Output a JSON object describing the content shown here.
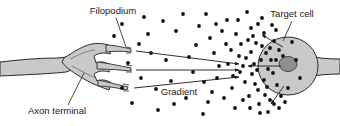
{
  "figure": {
    "domain": "biology-diagram",
    "width": 340,
    "height": 126,
    "background_color": "#ffffff"
  },
  "colors": {
    "cell_fill": "#c9c9c9",
    "cell_stroke": "#2b2b2b",
    "nucleus_fill": "#8f8f8f",
    "nucleus_stroke": "#3a3a3a",
    "dot_color": "#111111",
    "line_color": "#1a1a1a",
    "text_color": "#1a1a1a"
  },
  "labels": [
    {
      "id": "filopodium",
      "text": "Filopodium",
      "x": 113,
      "y": 14,
      "anchor": "middle",
      "leader": {
        "x1": 116,
        "y1": 18,
        "x2": 126,
        "y2": 47
      }
    },
    {
      "id": "target-cell",
      "text": "Target cell",
      "x": 292,
      "y": 17,
      "anchor": "middle",
      "leader": {
        "x1": 292,
        "y1": 21,
        "x2": 283,
        "y2": 41
      }
    },
    {
      "id": "axon-terminal",
      "text": "Axon terminal",
      "x": 57,
      "y": 114,
      "anchor": "middle",
      "leader": {
        "x1": 68,
        "y1": 105,
        "x2": 84,
        "y2": 73
      }
    },
    {
      "id": "gradient",
      "text": "Gradient",
      "x": 179,
      "y": 95,
      "anchor": "middle",
      "leader": null
    }
  ],
  "structures": {
    "axon_shaft": {
      "name": "axon-shaft",
      "description": "tapered tube entering from left edge widening into the terminal bouton"
    },
    "axon_terminal": {
      "name": "axon-terminal-bouton",
      "description": "swollen triangular terminal from which three filopodia branch"
    },
    "filopodia": [
      {
        "id": "filopodium-upper",
        "tip_x": 131,
        "tip_y": 50
      },
      {
        "id": "filopodium-middle",
        "tip_x": 131,
        "tip_y": 69
      },
      {
        "id": "filopodium-lower",
        "tip_x": 128,
        "tip_y": 88
      }
    ],
    "target_cell": {
      "name": "target-cell-body",
      "cx": 288,
      "cy": 66,
      "rx": 30,
      "ry": 29,
      "nucleus": {
        "cx": 288,
        "cy": 64,
        "rx": 9,
        "ry": 7.5
      },
      "neurite_tail": "tapering process leaving the cell to the right edge"
    }
  },
  "guidance_arrows": [
    {
      "id": "guidance-arrow-upper",
      "from_x": 136,
      "from_y": 51,
      "to_x": 239,
      "to_y": 64
    },
    {
      "id": "guidance-arrow-middle",
      "from_x": 136,
      "from_y": 70,
      "to_x": 239,
      "to_y": 70
    },
    {
      "id": "guidance-arrow-lower",
      "from_x": 134,
      "from_y": 88,
      "to_x": 239,
      "to_y": 77
    }
  ],
  "release_arrows": [
    {
      "id": "release-arrow-upper",
      "from_x": 283,
      "from_y": 47,
      "to_x": 262,
      "to_y": 35
    },
    {
      "id": "release-arrow-middle",
      "from_x": 281,
      "from_y": 66,
      "to_x": 248,
      "to_y": 66
    },
    {
      "id": "release-arrow-lower",
      "from_x": 284,
      "from_y": 86,
      "to_x": 271,
      "to_y": 104
    }
  ],
  "gradient_dots": {
    "description": "Diffusible chemoattractant molecules, densest adjacent to the target cell and sparse near the axon terminal",
    "radius": 1.9,
    "count": 96,
    "points": [
      [
        122,
        24
      ],
      [
        148,
        34
      ],
      [
        206,
        14
      ],
      [
        196,
        45
      ],
      [
        166,
        60
      ],
      [
        132,
        103
      ],
      [
        158,
        110
      ],
      [
        186,
        98
      ],
      [
        193,
        72
      ],
      [
        214,
        53
      ],
      [
        222,
        31
      ],
      [
        232,
        88
      ],
      [
        203,
        114
      ],
      [
        176,
        31
      ],
      [
        238,
        20
      ],
      [
        241,
        44
      ],
      [
        228,
        64
      ],
      [
        217,
        78
      ],
      [
        243,
        100
      ],
      [
        251,
        28
      ],
      [
        246,
        58
      ],
      [
        252,
        74
      ],
      [
        235,
        108
      ],
      [
        256,
        43
      ],
      [
        258,
        90
      ],
      [
        262,
        18
      ],
      [
        264,
        33
      ],
      [
        266,
        53
      ],
      [
        268,
        69
      ],
      [
        264,
        80
      ],
      [
        270,
        100
      ],
      [
        272,
        25
      ],
      [
        274,
        41
      ],
      [
        276,
        60
      ],
      [
        277,
        85
      ],
      [
        279,
        108
      ],
      [
        247,
        12
      ],
      [
        254,
        64
      ],
      [
        259,
        104
      ],
      [
        268,
        112
      ],
      [
        231,
        50
      ],
      [
        224,
        98
      ],
      [
        212,
        92
      ],
      [
        199,
        26
      ],
      [
        189,
        57
      ],
      [
        171,
        81
      ],
      [
        163,
        21
      ],
      [
        151,
        53
      ],
      [
        141,
        78
      ],
      [
        128,
        63
      ],
      [
        245,
        82
      ],
      [
        251,
        52
      ],
      [
        257,
        70
      ],
      [
        261,
        60
      ],
      [
        265,
        95
      ],
      [
        270,
        48
      ],
      [
        273,
        73
      ],
      [
        276,
        30
      ],
      [
        279,
        50
      ],
      [
        281,
        96
      ],
      [
        258,
        24
      ],
      [
        249,
        96
      ],
      [
        240,
        72
      ],
      [
        236,
        34
      ],
      [
        227,
        20
      ],
      [
        219,
        66
      ],
      [
        210,
        38
      ],
      [
        208,
        102
      ],
      [
        183,
        14
      ],
      [
        174,
        104
      ],
      [
        156,
        89
      ],
      [
        144,
        17
      ],
      [
        139,
        44
      ],
      [
        122,
        88
      ],
      [
        114,
        36
      ],
      [
        292,
        42
      ],
      [
        296,
        60
      ],
      [
        288,
        88
      ],
      [
        300,
        78
      ],
      [
        283,
        56
      ],
      [
        271,
        60
      ],
      [
        262,
        46
      ],
      [
        255,
        84
      ],
      [
        248,
        40
      ],
      [
        243,
        66
      ],
      [
        267,
        87
      ],
      [
        274,
        104
      ],
      [
        260,
        113
      ],
      [
        250,
        108
      ],
      [
        285,
        102
      ],
      [
        253,
        36
      ],
      [
        239,
        56
      ],
      [
        233,
        76
      ],
      [
        226,
        44
      ],
      [
        216,
        24
      ],
      [
        204,
        82
      ]
    ]
  }
}
